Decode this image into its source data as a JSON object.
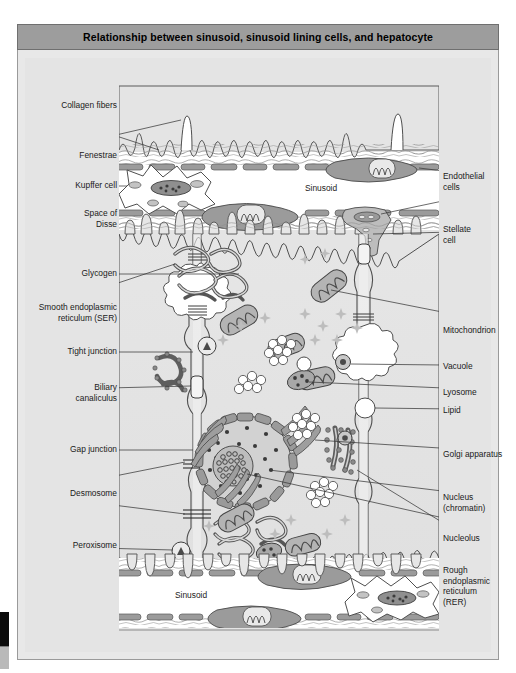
{
  "title": "Relationship between sinusoid, sinusoid lining cells, and hepatocyte",
  "labels_left": [
    {
      "key": "collagen_fibers",
      "text": "Collagen fibers"
    },
    {
      "key": "fenestrae",
      "text": "Fenestrae"
    },
    {
      "key": "kupffer_cell",
      "text": "Kupffer cell"
    },
    {
      "key": "space_of_disse",
      "text": "Space of\nDisse"
    },
    {
      "key": "glycogen",
      "text": "Glycogen"
    },
    {
      "key": "ser",
      "text": "Smooth endoplasmic\nreticulum (SER)"
    },
    {
      "key": "tight_junction",
      "text": "Tight junction"
    },
    {
      "key": "biliary_canaliculus",
      "text": "Biliary\ncanaliculus"
    },
    {
      "key": "gap_junction",
      "text": "Gap junction"
    },
    {
      "key": "desmosome",
      "text": "Desmosome"
    },
    {
      "key": "peroxisome",
      "text": "Peroxisome"
    }
  ],
  "labels_right": [
    {
      "key": "endothelial_cells",
      "text": "Endothelial\ncells"
    },
    {
      "key": "stellate_cell",
      "text": "Stellate\ncell"
    },
    {
      "key": "mitochondrion",
      "text": "Mitochondrion"
    },
    {
      "key": "vacuole",
      "text": "Vacuole"
    },
    {
      "key": "lyosome",
      "text": "Lyosome"
    },
    {
      "key": "lipid",
      "text": "Lipid"
    },
    {
      "key": "golgi_apparatus",
      "text": "Golgi apparatus"
    },
    {
      "key": "nucleus_chromatin",
      "text": "Nucleus\n(chromatin)"
    },
    {
      "key": "nucleolus",
      "text": "Nucleolus"
    },
    {
      "key": "rer",
      "text": "Rough\nendoplasmic\nreticulum\n(RER)"
    }
  ],
  "inline_labels": [
    {
      "key": "sinusoid_top",
      "text": "Sinusoid"
    },
    {
      "key": "sinusoid_bottom",
      "text": "Sinusoid"
    }
  ],
  "colors": {
    "title_bar": "#9d9d9d",
    "card_bg": "#e8e8e8",
    "plate_bg": "#e4e4e4",
    "cytoplasm": "#e2e2e2",
    "lumen_white": "#ffffff",
    "endothelium_gray": "#9b9b9b",
    "organelle_gray": "#a8a8a8",
    "dark_outline": "#4a4a4a",
    "nucleus_fill": "#d2d2d2",
    "nucleolus_fill": "#bdbdbd",
    "stroke": "#444444"
  }
}
